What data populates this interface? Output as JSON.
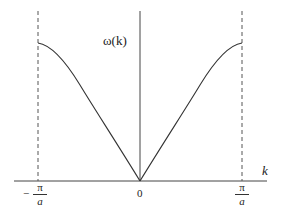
{
  "diagram": {
    "type": "dispersion-relation",
    "y_axis_label": "ω(k)",
    "x_axis_label": "k",
    "ticks": {
      "left": {
        "sign": "−",
        "numerator": "π",
        "denominator": "a"
      },
      "center": "0",
      "right": {
        "numerator": "π",
        "denominator": "a"
      }
    },
    "curve": "ω(k) ∝ |sin(ka/2)|",
    "boundary_lines": "dashed vertical at k = ±π/a",
    "colors": {
      "line": "#333333",
      "dashed": "#555555",
      "background": "#ffffff"
    }
  }
}
